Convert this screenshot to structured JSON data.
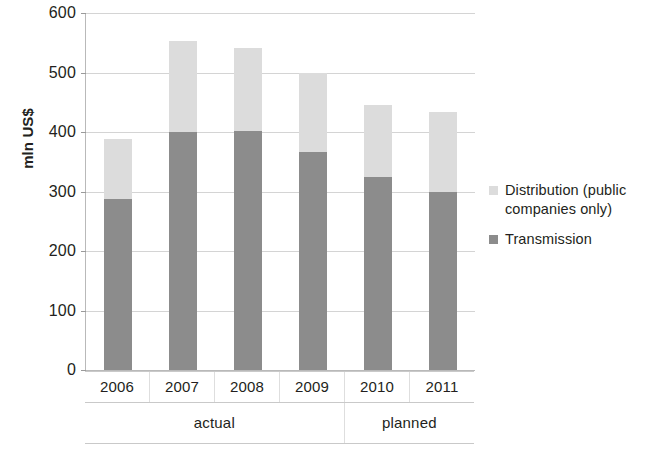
{
  "chart_data": {
    "type": "bar",
    "subtype": "stacked-bar",
    "title": "",
    "xlabel": "",
    "ylabel": "mln US$",
    "ylim": [
      0,
      600
    ],
    "ytick_step": 100,
    "yticks": [
      0,
      100,
      200,
      300,
      400,
      500,
      600
    ],
    "ytick_labels": [
      "0",
      "100",
      "200",
      "300",
      "400",
      "500",
      "600"
    ],
    "grid": true,
    "grid_axis": "y",
    "legend_position": "right",
    "categories": [
      "2006",
      "2007",
      "2008",
      "2009",
      "2010",
      "2011"
    ],
    "category_groups": [
      {
        "label": "actual",
        "categories": [
          "2006",
          "2007",
          "2008",
          "2009"
        ],
        "span": 4
      },
      {
        "label": "planned",
        "categories": [
          "2010",
          "2011"
        ],
        "span": 2
      }
    ],
    "series": [
      {
        "name": "Transmission",
        "color": "#8c8c8c",
        "values": [
          288,
          400,
          402,
          366,
          324,
          300
        ]
      },
      {
        "name": "Distribution (public companies only)",
        "color": "#dcdcdc",
        "values": [
          100,
          153,
          140,
          133,
          122,
          134
        ]
      }
    ],
    "totals": [
      388,
      553,
      542,
      499,
      446,
      434
    ],
    "legend": [
      {
        "label": "Distribution (public companies only)",
        "color": "#dcdcdc",
        "swatch_name": "distribution-swatch"
      },
      {
        "label": "Transmission",
        "color": "#8c8c8c",
        "swatch_name": "transmission-swatch"
      }
    ]
  }
}
